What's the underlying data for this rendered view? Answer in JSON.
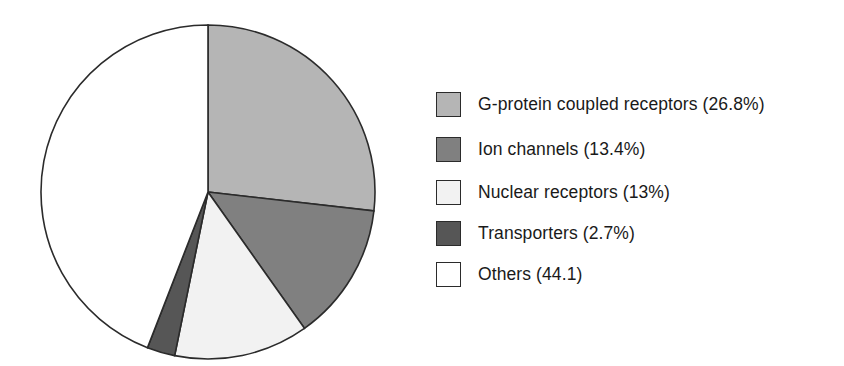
{
  "chart_data": {
    "type": "pie",
    "title": "",
    "subtitle": "",
    "xlabel": "",
    "ylabel": "",
    "legend_position": "right",
    "grid": false,
    "start_angle_deg": 0,
    "direction": "clockwise",
    "categories": [
      "G-protein coupled receptors",
      "Ion channels",
      "Nuclear receptors",
      "Transporters",
      "Others"
    ],
    "values": [
      26.8,
      13.4,
      13,
      2.7,
      44.1
    ],
    "value_unit": "%",
    "labels": [
      "G-protein coupled receptors (26.8%)",
      "Ion channels (13.4%)",
      "Nuclear receptors (13%)",
      "Transporters (2.7%)",
      "Others (44.1)"
    ],
    "slice_colors": [
      "#b5b5b5",
      "#808080",
      "#f2f2f2",
      "#565656",
      "#ffffff"
    ],
    "outline_color": "#2b2b2b",
    "slices": [
      {
        "name": "G-protein coupled receptors",
        "value": 26.8,
        "display": "26.8%",
        "color": "#b5b5b5"
      },
      {
        "name": "Ion channels",
        "value": 13.4,
        "display": "13.4%",
        "color": "#808080"
      },
      {
        "name": "Nuclear receptors",
        "value": 13,
        "display": "13%",
        "color": "#f2f2f2"
      },
      {
        "name": "Transporters",
        "value": 2.7,
        "display": "2.7%",
        "color": "#565656"
      },
      {
        "name": "Others",
        "value": 44.1,
        "display": "44.1",
        "color": "#ffffff"
      }
    ]
  },
  "legend": {
    "items": [
      {
        "label": "G-protein coupled receptors (26.8%)",
        "color": "#b5b5b5"
      },
      {
        "label": "Ion channels (13.4%)",
        "color": "#808080"
      },
      {
        "label": "Nuclear receptors (13%)",
        "color": "#f2f2f2"
      },
      {
        "label": "Transporters (2.7%)",
        "color": "#565656"
      },
      {
        "label": "Others (44.1)",
        "color": "#ffffff"
      }
    ]
  }
}
